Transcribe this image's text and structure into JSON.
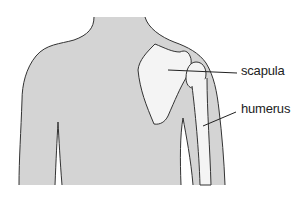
{
  "diagram": {
    "colors": {
      "body_fill": "#d4d4d4",
      "bone_fill": "#f4f4f4",
      "outline": "#333333",
      "background": "#ffffff"
    },
    "labels": [
      {
        "id": "scapula",
        "text": "scapula"
      },
      {
        "id": "humerus",
        "text": "humerus"
      }
    ]
  }
}
